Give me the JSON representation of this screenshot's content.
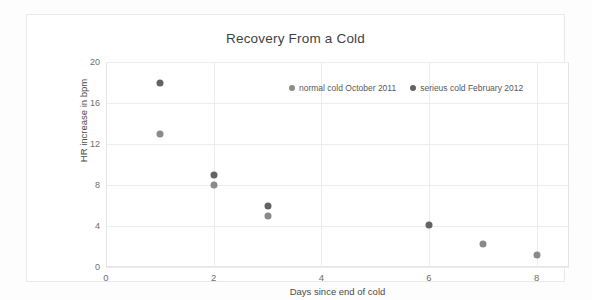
{
  "chart_data": {
    "type": "scatter",
    "title": "Recovery From a Cold",
    "xlabel": "Days since end of cold",
    "ylabel": "HR increase in bpm",
    "xlim": [
      0,
      8.6
    ],
    "ylim": [
      0,
      20
    ],
    "xticks": [
      "0",
      "2",
      "4",
      "6",
      "8"
    ],
    "xtick_values": [
      0,
      2,
      4,
      6,
      8
    ],
    "yticks": [
      "0",
      "4",
      "8",
      "12",
      "16",
      "20"
    ],
    "ytick_values": [
      0,
      4,
      8,
      12,
      16,
      20
    ],
    "grid": true,
    "legend_position": "upper center",
    "series": [
      {
        "name": "normal cold October 2011",
        "color": "#8a8a8a",
        "points": [
          {
            "x": 1,
            "y": 13
          },
          {
            "x": 2,
            "y": 8
          },
          {
            "x": 3,
            "y": 5
          },
          {
            "x": 7,
            "y": 2.2
          },
          {
            "x": 8,
            "y": 1.2
          }
        ]
      },
      {
        "name": "serieus cold February 2012",
        "color": "#636363",
        "points": [
          {
            "x": 1,
            "y": 18
          },
          {
            "x": 2,
            "y": 9
          },
          {
            "x": 3,
            "y": 6
          },
          {
            "x": 6,
            "y": 4.1
          }
        ]
      }
    ]
  }
}
